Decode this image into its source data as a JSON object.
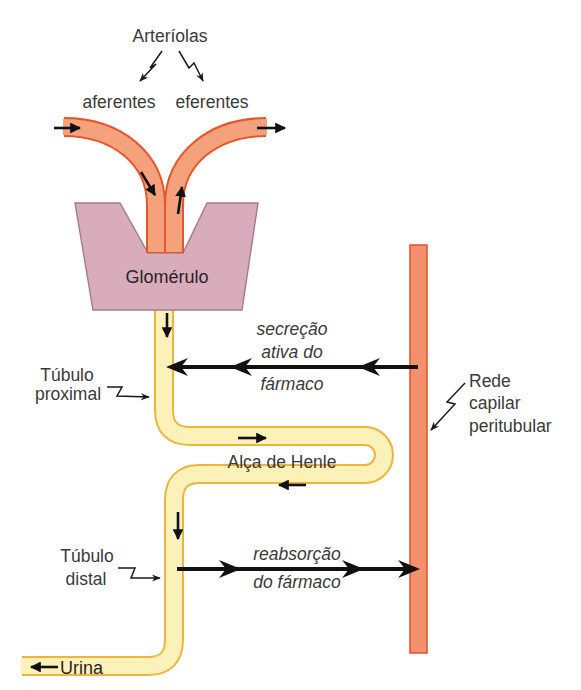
{
  "diagram": {
    "arterioles_title": "Arteríolas",
    "afferent_label": "aferentes",
    "efferent_label": "eferentes",
    "glomerulus_label": "Glomérulo",
    "proximal_tubule_label": [
      "Túbulo",
      "proximal"
    ],
    "secretion_label": [
      "secreção",
      "ativa do",
      "fármaco"
    ],
    "capillary_label": [
      "Rede",
      "capilar",
      "peritubular"
    ],
    "loop_of_henle_label": "Alça de Henle",
    "distal_tubule_label": [
      "Túbulo",
      "distal"
    ],
    "reabsorption_label": [
      "reabsorção",
      "do fármaco"
    ],
    "urine_label": "Urina"
  },
  "colors": {
    "arteriole_fill": "#f5a27c",
    "arteriole_stroke": "#e5572b",
    "glomerulus_fill": "#d8acbb",
    "glomerulus_stroke": "#a9788f",
    "tubule_fill": "#fcf2b9",
    "tubule_stroke": "#efb43e",
    "capillary_fill": "#f3916e",
    "capillary_stroke": "#e0502a",
    "arrow": "#111111",
    "text": "#3a3a3a"
  }
}
